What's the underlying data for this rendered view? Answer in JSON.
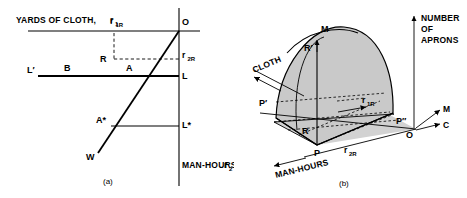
{
  "figure": {
    "panel_a": {
      "caption": "(a)",
      "axis_labels": {
        "cloth_axis": "YARDS OF CLOTH,",
        "cloth_axis_sub": "r",
        "cloth_axis_sub_index": "1",
        "manhours_axis": "MAN-HOURS,",
        "manhours_axis_sub": "r",
        "manhours_axis_sub_index": "2"
      },
      "point_labels": [
        {
          "name": "O",
          "text": "O"
        },
        {
          "name": "R",
          "text": "R"
        },
        {
          "name": "L-prime",
          "text": "L′"
        },
        {
          "name": "B",
          "text": "B"
        },
        {
          "name": "A",
          "text": "A"
        },
        {
          "name": "L",
          "text": "L"
        },
        {
          "name": "A-star",
          "text": "A*"
        },
        {
          "name": "L-star",
          "text": "L*"
        },
        {
          "name": "W",
          "text": "W"
        }
      ],
      "coordinate_labels": [
        {
          "name": "r1R",
          "base": "r",
          "sub": "1R"
        },
        {
          "name": "r2R",
          "base": "r",
          "sub": "2R"
        }
      ]
    },
    "panel_b": {
      "caption": "(b)",
      "axis_labels": {
        "vertical_axis_line1": "NUMBER",
        "vertical_axis_line2": "OF",
        "vertical_axis_line3": "APRONS",
        "cloth_axis": "CLOTH",
        "manhours_axis": "MAN-HOURS",
        "ray_m": "M",
        "ray_c": "C"
      },
      "point_labels": [
        {
          "name": "M",
          "text": "M"
        },
        {
          "name": "R-prime",
          "text": "R′"
        },
        {
          "name": "P-prime",
          "text": "P′"
        },
        {
          "name": "R",
          "text": "R"
        },
        {
          "name": "P",
          "text": "P"
        },
        {
          "name": "P-double-prime",
          "text": "P″"
        },
        {
          "name": "O",
          "text": "O"
        }
      ],
      "coordinate_labels": [
        {
          "name": "r1R",
          "base": "r",
          "sub": "1R"
        },
        {
          "name": "r2R",
          "base": "r",
          "sub": "2R"
        }
      ]
    },
    "colors": {
      "line": "#000000",
      "surface_fill": "#c9c9c9",
      "side_fill": "#b9b9b9",
      "base_fill": "#d2d2d2",
      "background": "#ffffff"
    }
  }
}
